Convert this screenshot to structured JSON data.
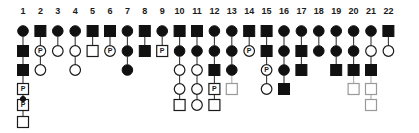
{
  "figure": {
    "kind": "pedigree-chart",
    "title": "",
    "columns_count": 22,
    "generations_count": 6,
    "colors": {
      "affected_fill": "#111111",
      "unaffected_fill": "#ffffff",
      "stroke": "#1a1a1a",
      "connector": "#3a3a3a",
      "faded_stroke": "#999999"
    },
    "layout": {
      "first_column_x": 23,
      "column_spacing": 17.4,
      "label_y": 14,
      "row_y": [
        31,
        51,
        70,
        89,
        105,
        122
      ],
      "symbol_size": 11
    },
    "legend_notes": {
      "square": "male",
      "circle": "female",
      "filled": "affected",
      "open": "unaffected",
      "P_marker": "proband / P-labelled individual"
    }
  },
  "column_labels": [
    "1",
    "2",
    "3",
    "4",
    "5",
    "6",
    "7",
    "8",
    "9",
    "10",
    "11",
    "12",
    "13",
    "14",
    "15",
    "16",
    "17",
    "18",
    "19",
    "20",
    "21",
    "22"
  ],
  "p_label_text": "P",
  "columns": [
    {
      "index": 1,
      "label": "1",
      "members": [
        {
          "row": 1,
          "shape": "circle",
          "state": "filled",
          "p": false
        },
        {
          "row": 2,
          "shape": "square",
          "state": "filled",
          "p": false
        },
        {
          "row": 3,
          "shape": "square",
          "state": "filled",
          "p": false
        },
        {
          "row": 4,
          "shape": "square",
          "state": "open",
          "p": true
        },
        {
          "row": 5,
          "shape": "square",
          "state": "open",
          "p": true,
          "top_dot": true
        },
        {
          "row": 6,
          "shape": "square",
          "state": "open",
          "p": false
        }
      ]
    },
    {
      "index": 2,
      "label": "2",
      "members": [
        {
          "row": 1,
          "shape": "square",
          "state": "filled",
          "p": false
        },
        {
          "row": 2,
          "shape": "circle",
          "state": "open",
          "p": true
        },
        {
          "row": 3,
          "shape": "circle",
          "state": "open",
          "p": false
        }
      ]
    },
    {
      "index": 3,
      "label": "3",
      "members": [
        {
          "row": 1,
          "shape": "circle",
          "state": "filled",
          "p": false
        },
        {
          "row": 2,
          "shape": "circle",
          "state": "open",
          "p": false
        }
      ]
    },
    {
      "index": 4,
      "label": "4",
      "members": [
        {
          "row": 1,
          "shape": "circle",
          "state": "filled",
          "p": false
        },
        {
          "row": 2,
          "shape": "circle",
          "state": "open",
          "p": false
        },
        {
          "row": 3,
          "shape": "circle",
          "state": "open",
          "p": false
        }
      ]
    },
    {
      "index": 5,
      "label": "5",
      "members": [
        {
          "row": 1,
          "shape": "square",
          "state": "filled",
          "p": false
        },
        {
          "row": 2,
          "shape": "square",
          "state": "open",
          "p": false
        }
      ]
    },
    {
      "index": 6,
      "label": "6",
      "members": [
        {
          "row": 1,
          "shape": "square",
          "state": "filled",
          "p": false
        },
        {
          "row": 2,
          "shape": "circle",
          "state": "open",
          "p": true
        }
      ]
    },
    {
      "index": 7,
      "label": "7",
      "members": [
        {
          "row": 1,
          "shape": "circle",
          "state": "filled",
          "p": false
        },
        {
          "row": 2,
          "shape": "circle",
          "state": "filled",
          "p": false
        },
        {
          "row": 3,
          "shape": "circle",
          "state": "filled",
          "p": false
        }
      ]
    },
    {
      "index": 8,
      "label": "8",
      "members": [
        {
          "row": 1,
          "shape": "square",
          "state": "filled",
          "p": false
        },
        {
          "row": 2,
          "shape": "square",
          "state": "filled",
          "p": false
        }
      ]
    },
    {
      "index": 9,
      "label": "9",
      "members": [
        {
          "row": 1,
          "shape": "circle",
          "state": "filled",
          "p": false
        },
        {
          "row": 2,
          "shape": "square",
          "state": "open",
          "p": true
        }
      ]
    },
    {
      "index": 10,
      "label": "10",
      "members": [
        {
          "row": 1,
          "shape": "square",
          "state": "filled",
          "p": false
        },
        {
          "row": 2,
          "shape": "circle",
          "state": "filled",
          "p": false
        },
        {
          "row": 3,
          "shape": "circle",
          "state": "open",
          "p": false
        },
        {
          "row": 4,
          "shape": "circle",
          "state": "open",
          "p": false
        },
        {
          "row": 5,
          "shape": "square",
          "state": "open",
          "p": false
        }
      ]
    },
    {
      "index": 11,
      "label": "11",
      "members": [
        {
          "row": 1,
          "shape": "square",
          "state": "filled",
          "p": false
        },
        {
          "row": 2,
          "shape": "circle",
          "state": "filled",
          "p": false
        },
        {
          "row": 3,
          "shape": "circle",
          "state": "open",
          "p": false
        },
        {
          "row": 4,
          "shape": "circle",
          "state": "open",
          "p": false
        },
        {
          "row": 5,
          "shape": "circle",
          "state": "open",
          "p": false
        }
      ]
    },
    {
      "index": 12,
      "label": "12",
      "members": [
        {
          "row": 1,
          "shape": "circle",
          "state": "filled",
          "p": false
        },
        {
          "row": 2,
          "shape": "circle",
          "state": "filled",
          "p": false
        },
        {
          "row": 3,
          "shape": "square",
          "state": "filled",
          "p": false
        },
        {
          "row": 4,
          "shape": "square",
          "state": "open",
          "p": true
        },
        {
          "row": 5,
          "shape": "square",
          "state": "open",
          "p": false
        }
      ]
    },
    {
      "index": 13,
      "label": "13",
      "members": [
        {
          "row": 1,
          "shape": "circle",
          "state": "filled",
          "p": false
        },
        {
          "row": 2,
          "shape": "circle",
          "state": "filled",
          "p": false
        },
        {
          "row": 3,
          "shape": "circle",
          "state": "filled",
          "p": false
        },
        {
          "row": 4,
          "shape": "square",
          "state": "open-light",
          "p": false
        }
      ]
    },
    {
      "index": 14,
      "label": "14",
      "members": [
        {
          "row": 1,
          "shape": "square",
          "state": "filled",
          "p": false
        },
        {
          "row": 2,
          "shape": "circle",
          "state": "open",
          "p": true
        }
      ]
    },
    {
      "index": 15,
      "label": "15",
      "members": [
        {
          "row": 1,
          "shape": "square",
          "state": "filled",
          "p": false
        },
        {
          "row": 2,
          "shape": "square",
          "state": "filled",
          "p": false
        },
        {
          "row": 3,
          "shape": "circle",
          "state": "open",
          "p": true
        },
        {
          "row": 4,
          "shape": "circle",
          "state": "open",
          "p": false
        }
      ]
    },
    {
      "index": 16,
      "label": "16",
      "members": [
        {
          "row": 1,
          "shape": "circle",
          "state": "filled",
          "p": false
        },
        {
          "row": 2,
          "shape": "circle",
          "state": "filled",
          "p": false
        },
        {
          "row": 3,
          "shape": "circle",
          "state": "filled",
          "p": false
        },
        {
          "row": 4,
          "shape": "square",
          "state": "filled",
          "p": false
        }
      ]
    },
    {
      "index": 17,
      "label": "17",
      "members": [
        {
          "row": 1,
          "shape": "circle",
          "state": "filled",
          "p": false
        },
        {
          "row": 2,
          "shape": "square",
          "state": "filled",
          "p": false
        },
        {
          "row": 3,
          "shape": "square",
          "state": "filled",
          "p": false
        }
      ]
    },
    {
      "index": 18,
      "label": "18",
      "members": [
        {
          "row": 1,
          "shape": "circle",
          "state": "filled",
          "p": false
        },
        {
          "row": 2,
          "shape": "circle",
          "state": "filled",
          "p": false
        }
      ]
    },
    {
      "index": 19,
      "label": "19",
      "members": [
        {
          "row": 1,
          "shape": "circle",
          "state": "filled",
          "p": false
        },
        {
          "row": 2,
          "shape": "circle",
          "state": "filled",
          "p": false
        },
        {
          "row": 3,
          "shape": "square",
          "state": "filled",
          "p": false
        }
      ]
    },
    {
      "index": 20,
      "label": "20",
      "members": [
        {
          "row": 1,
          "shape": "circle",
          "state": "filled",
          "p": false
        },
        {
          "row": 2,
          "shape": "circle",
          "state": "filled",
          "p": false
        },
        {
          "row": 3,
          "shape": "square",
          "state": "filled",
          "p": false
        },
        {
          "row": 4,
          "shape": "square",
          "state": "open-light",
          "p": false
        }
      ]
    },
    {
      "index": 21,
      "label": "21",
      "members": [
        {
          "row": 1,
          "shape": "circle",
          "state": "filled",
          "p": false
        },
        {
          "row": 2,
          "shape": "circle",
          "state": "open",
          "p": false
        },
        {
          "row": 3,
          "shape": "square",
          "state": "filled",
          "p": false
        },
        {
          "row": 4,
          "shape": "square",
          "state": "open-light",
          "p": false
        },
        {
          "row": 5,
          "shape": "square",
          "state": "open-light",
          "p": false
        }
      ]
    },
    {
      "index": 22,
      "label": "22",
      "members": [
        {
          "row": 1,
          "shape": "square",
          "state": "filled",
          "p": false
        },
        {
          "row": 2,
          "shape": "circle",
          "state": "open",
          "p": false
        }
      ]
    }
  ]
}
